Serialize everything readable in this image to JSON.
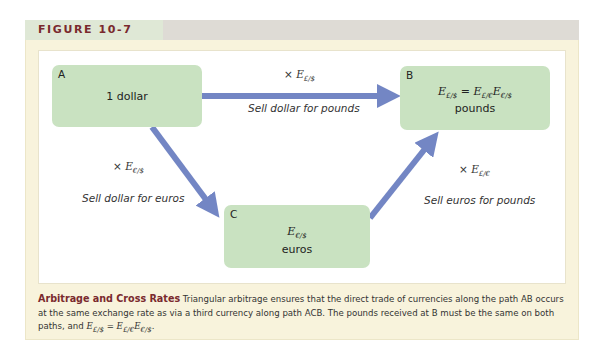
{
  "figure": {
    "label": "FIGURE 10-7",
    "colors": {
      "frame_bg": "#f8f3dc",
      "header_tab_bg": "#dfe8d6",
      "header_band_bg": "#dedbd5",
      "box_fill": "#c9e2c1",
      "arrow": "#7386c4",
      "title_color": "#7a2a2e"
    }
  },
  "diagram": {
    "nodes": [
      {
        "id": "A",
        "letter": "A",
        "line1": "1 dollar",
        "line2": ""
      },
      {
        "id": "B",
        "letter": "B",
        "formula": {
          "lhs": "E",
          "lhs_sub": "£/$",
          "eq": " = ",
          "r1": "E",
          "r1_sub": "£/€",
          "r2": "E",
          "r2_sub": "€/$"
        },
        "line2": "pounds"
      },
      {
        "id": "C",
        "letter": "C",
        "formula": {
          "sym": "E",
          "sub": "€/$"
        },
        "line2": "euros"
      }
    ],
    "edges": [
      {
        "from": "A",
        "to": "B",
        "rate_prefix": "× ",
        "rate_sym": "E",
        "rate_sub": "£/$",
        "label": "Sell dollar for pounds"
      },
      {
        "from": "A",
        "to": "C",
        "rate_prefix": "× ",
        "rate_sym": "E",
        "rate_sub": "€/$",
        "label": "Sell dollar for euros"
      },
      {
        "from": "C",
        "to": "B",
        "rate_prefix": "× ",
        "rate_sym": "E",
        "rate_sub": "£/€",
        "label": "Sell euros for pounds"
      }
    ]
  },
  "caption": {
    "title": "Arbitrage and Cross Rates",
    "body": " Triangular arbitrage ensures that the direct trade of currencies along the path AB occurs at the same exchange rate as via a third currency along path ACB. The pounds received at B must be the same on both paths, and ",
    "eq_lhs": "E",
    "eq_lhs_sub": "£/$",
    "eq_mid": " = ",
    "eq_r1": "E",
    "eq_r1_sub": "£/€",
    "eq_r2": "E",
    "eq_r2_sub": "€/$",
    "end": "."
  }
}
